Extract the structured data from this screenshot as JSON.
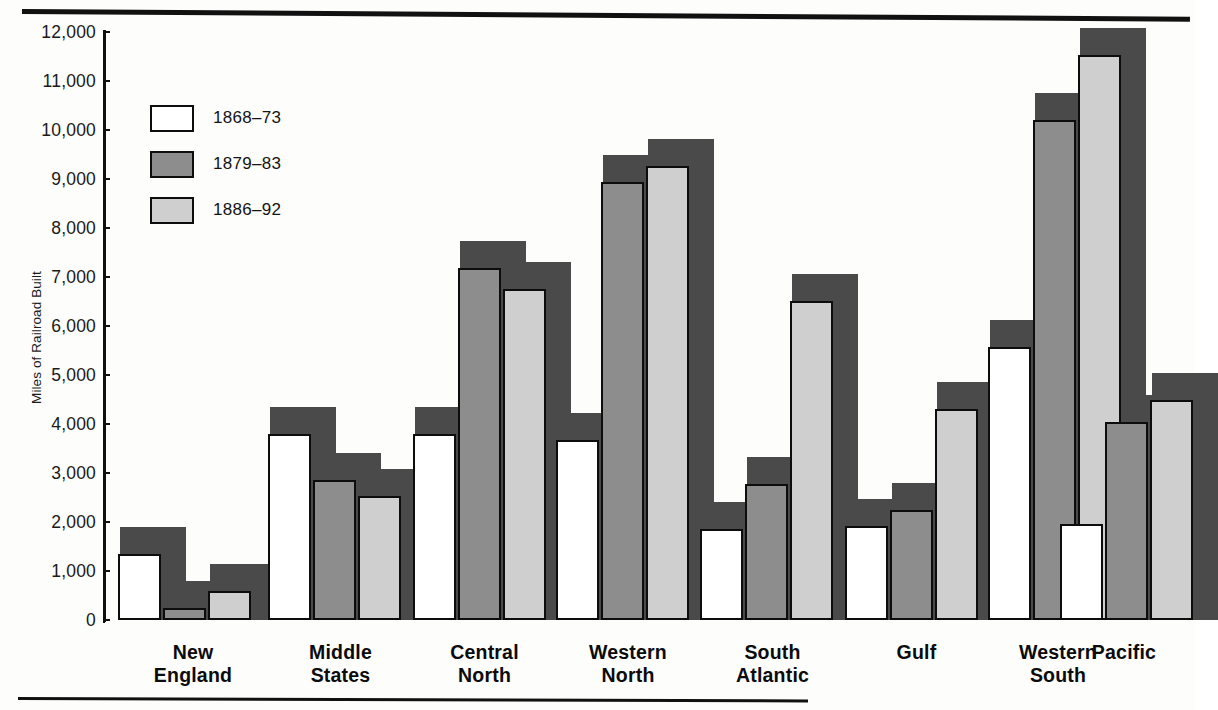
{
  "header": {
    "cropped_text": ""
  },
  "chart_data": {
    "type": "bar",
    "title": "",
    "xlabel": "",
    "ylabel": "Miles of Railroad Built",
    "ylim": [
      0,
      12000
    ],
    "ytick_labels": [
      "12,000",
      "11,000",
      "10,000",
      "9,000",
      "8,000",
      "7,000",
      "6,000",
      "5,000",
      "4,000",
      "3,000",
      "2,000",
      "1,000",
      "0"
    ],
    "ytick_values": [
      12000,
      11000,
      10000,
      9000,
      8000,
      7000,
      6000,
      5000,
      4000,
      3000,
      2000,
      1000,
      0
    ],
    "grid": false,
    "legend_position": "upper-left",
    "categories": [
      "New England",
      "Middle States",
      "Central North",
      "Western North",
      "South Atlantic",
      "Gulf",
      "Western South",
      "Pacific"
    ],
    "category_lines": [
      [
        "New",
        "England"
      ],
      [
        "Middle",
        "States"
      ],
      [
        "Central",
        "North"
      ],
      [
        "Western",
        "North"
      ],
      [
        "South",
        "Atlantic"
      ],
      [
        "Gulf"
      ],
      [
        "Western",
        "South"
      ],
      [
        "Pacific"
      ]
    ],
    "series": [
      {
        "name": "1868–73",
        "color": "#ffffff",
        "values": [
          1350,
          3800,
          3800,
          3680,
          1850,
          1920,
          5570,
          1950
        ]
      },
      {
        "name": "1879–83",
        "color": "#8d8d8d",
        "values": [
          250,
          2850,
          7180,
          8930,
          2780,
          2240,
          10200,
          4050
        ]
      },
      {
        "name": "1886–92",
        "color": "#cfcfcf",
        "values": [
          600,
          2530,
          6750,
          9270,
          6520,
          4300,
          11530,
          4480
        ]
      }
    ]
  },
  "colors": {
    "ink": "#0d0d0d",
    "shadow": "#4a4a4a",
    "series_1868_73": "#ffffff",
    "series_1879_83": "#8d8d8d",
    "series_1886_92": "#cfcfcf"
  }
}
